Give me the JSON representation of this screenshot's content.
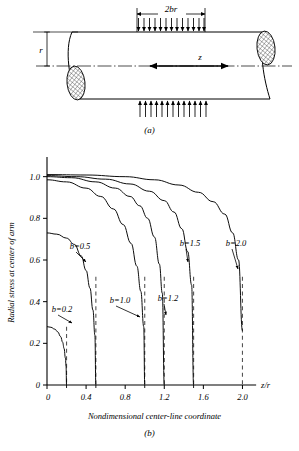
{
  "figure": {
    "panel_a": {
      "caption": "(a)",
      "dimension_load_label": "2br",
      "dimension_radius_label": "r",
      "axis_label": "z",
      "load_arrow_count": 13,
      "description": "cylinder-with-distributed-radial-load"
    },
    "panel_b": {
      "caption": "(b)"
    }
  },
  "chart_data": {
    "type": "line",
    "title": "",
    "xlabel": "Nondimensional center-line coordinate",
    "ylabel": "Radial stress at center of arm",
    "x_axis_symbol": "z/r",
    "xlim": [
      0,
      2.2
    ],
    "ylim": [
      0,
      1.08
    ],
    "grid": false,
    "legend_position": "inline-labels",
    "xticks": [
      0,
      0.4,
      0.8,
      1.2,
      1.6,
      2.0
    ],
    "xtick_labels": [
      "0",
      "0.4",
      "0.8",
      "1.2",
      "1.6",
      "2.0"
    ],
    "x_minor_ticks": [
      0.2,
      0.5,
      1.0,
      1.5
    ],
    "yticks": [
      0,
      0.2,
      0.4,
      0.6,
      0.8,
      1.0
    ],
    "ytick_labels": [
      "0",
      "0.2",
      "0.4",
      "0.6",
      "0.8",
      "1.0"
    ],
    "series": [
      {
        "name": "b=0.2",
        "b": 0.2,
        "label": "b=0.2",
        "y0": 0.28,
        "asymptote_x": 0.2,
        "x": [
          0,
          0.04,
          0.08,
          0.11,
          0.14,
          0.16,
          0.175,
          0.188,
          0.195,
          0.2
        ],
        "values": [
          0.28,
          0.277,
          0.268,
          0.255,
          0.232,
          0.205,
          0.175,
          0.13,
          0.09,
          0.0
        ]
      },
      {
        "name": "b=0.5",
        "b": 0.5,
        "label": "b=0.5",
        "y0": 0.73,
        "asymptote_x": 0.5,
        "x": [
          0,
          0.1,
          0.2,
          0.28,
          0.35,
          0.4,
          0.44,
          0.47,
          0.49,
          0.5
        ],
        "values": [
          0.73,
          0.724,
          0.705,
          0.675,
          0.62,
          0.55,
          0.465,
          0.36,
          0.24,
          0.0
        ]
      },
      {
        "name": "b=1.0",
        "b": 1.0,
        "label": "b=1.0",
        "y0": 0.985,
        "asymptote_x": 1.0,
        "x": [
          0,
          0.2,
          0.4,
          0.55,
          0.68,
          0.78,
          0.86,
          0.92,
          0.96,
          0.99,
          1.0
        ],
        "values": [
          0.985,
          0.975,
          0.945,
          0.905,
          0.845,
          0.77,
          0.68,
          0.57,
          0.45,
          0.28,
          0.0
        ]
      },
      {
        "name": "b=1.2",
        "b": 1.2,
        "label": "b=1.2",
        "y0": 1.0,
        "asymptote_x": 1.2,
        "x": [
          0,
          0.25,
          0.5,
          0.7,
          0.85,
          0.95,
          1.03,
          1.1,
          1.15,
          1.18,
          1.2
        ],
        "values": [
          1.0,
          0.995,
          0.975,
          0.945,
          0.905,
          0.86,
          0.8,
          0.71,
          0.58,
          0.44,
          0.0
        ]
      },
      {
        "name": "b=1.5",
        "b": 1.5,
        "label": "b=1.5",
        "y0": 1.005,
        "asymptote_x": 1.5,
        "x": [
          0,
          0.3,
          0.6,
          0.85,
          1.05,
          1.2,
          1.3,
          1.38,
          1.44,
          1.48,
          1.5
        ],
        "values": [
          1.005,
          1.0,
          0.988,
          0.965,
          0.93,
          0.885,
          0.83,
          0.75,
          0.64,
          0.48,
          0.0
        ]
      },
      {
        "name": "b=2.0",
        "b": 2.0,
        "label": "b=2.0",
        "y0": 1.01,
        "asymptote_x": 2.0,
        "x": [
          0,
          0.4,
          0.8,
          1.1,
          1.35,
          1.55,
          1.7,
          1.82,
          1.9,
          1.96,
          2.0
        ],
        "values": [
          1.01,
          1.008,
          1.0,
          0.985,
          0.96,
          0.925,
          0.88,
          0.82,
          0.73,
          0.6,
          0.26
        ]
      }
    ],
    "asymptote_lines": [
      0.2,
      0.5,
      1.0,
      1.2,
      1.5,
      2.0
    ]
  }
}
